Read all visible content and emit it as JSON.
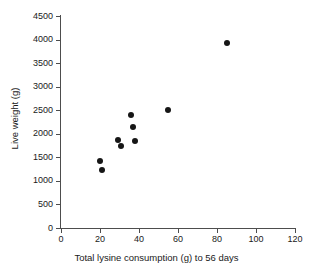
{
  "chart_data": {
    "type": "scatter",
    "title": "",
    "xlabel": "Total lysine consumption (g) to 56 days",
    "ylabel": "Live weight (g)",
    "xlim": [
      0,
      120
    ],
    "ylim": [
      0,
      4500
    ],
    "xticks": [
      0,
      20,
      40,
      60,
      80,
      100,
      120
    ],
    "yticks": [
      0,
      500,
      1000,
      1500,
      2000,
      2500,
      3000,
      3500,
      4000,
      4500
    ],
    "xtick_labels": [
      "0",
      "20",
      "40",
      "60",
      "80",
      "100",
      "120"
    ],
    "ytick_labels": [
      "0",
      "500",
      "1000",
      "1500",
      "2000",
      "2500",
      "3000",
      "3500",
      "4000",
      "4500"
    ],
    "grid": false,
    "legend": false,
    "marker": "filled-circle",
    "marker_color": "#161616",
    "series": [
      {
        "name": "Live weight vs lysine consumption",
        "points": [
          {
            "x": 20,
            "y": 1420
          },
          {
            "x": 21,
            "y": 1230
          },
          {
            "x": 29,
            "y": 1870
          },
          {
            "x": 31,
            "y": 1730
          },
          {
            "x": 36,
            "y": 2390
          },
          {
            "x": 37,
            "y": 2140
          },
          {
            "x": 38,
            "y": 1840
          },
          {
            "x": 55,
            "y": 2510
          },
          {
            "x": 85,
            "y": 3930
          }
        ]
      }
    ]
  },
  "axes": {
    "axis_color": "#4d4d4d",
    "label_color": "#1a1a1a"
  }
}
